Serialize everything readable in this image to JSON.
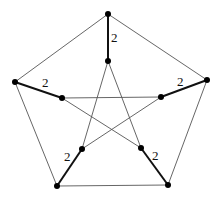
{
  "graph": {
    "name": "Petersen graph",
    "vertices": {
      "o0": [
        108,
        14
      ],
      "o1": [
        207,
        80
      ],
      "o2": [
        168,
        185
      ],
      "o3": [
        57,
        186
      ],
      "o4": [
        15,
        82
      ],
      "i0": [
        108,
        61
      ],
      "i1": [
        161,
        97
      ],
      "i2": [
        141,
        148
      ],
      "i3": [
        82,
        149
      ],
      "i4": [
        62,
        98
      ]
    },
    "edges": [
      {
        "from": "o0",
        "to": "o1"
      },
      {
        "from": "o1",
        "to": "o2"
      },
      {
        "from": "o2",
        "to": "o3"
      },
      {
        "from": "o3",
        "to": "o4"
      },
      {
        "from": "o4",
        "to": "o0"
      },
      {
        "from": "i0",
        "to": "i2"
      },
      {
        "from": "i2",
        "to": "i4"
      },
      {
        "from": "i4",
        "to": "i1"
      },
      {
        "from": "i1",
        "to": "i3"
      },
      {
        "from": "i3",
        "to": "i0"
      },
      {
        "from": "o0",
        "to": "i0",
        "weight": "2",
        "heavy": true,
        "label_pos": [
          111,
          42
        ]
      },
      {
        "from": "o1",
        "to": "i1",
        "weight": "2",
        "heavy": true,
        "label_pos": [
          177,
          86
        ]
      },
      {
        "from": "o2",
        "to": "i2",
        "weight": "2",
        "heavy": true,
        "label_pos": [
          152,
          160
        ]
      },
      {
        "from": "o3",
        "to": "i3",
        "weight": "2",
        "heavy": true,
        "label_pos": [
          64,
          161
        ]
      },
      {
        "from": "o4",
        "to": "i4",
        "weight": "2",
        "heavy": true,
        "label_pos": [
          42,
          87
        ]
      }
    ]
  },
  "labels": [
    "2",
    "2",
    "2",
    "2",
    "2"
  ]
}
